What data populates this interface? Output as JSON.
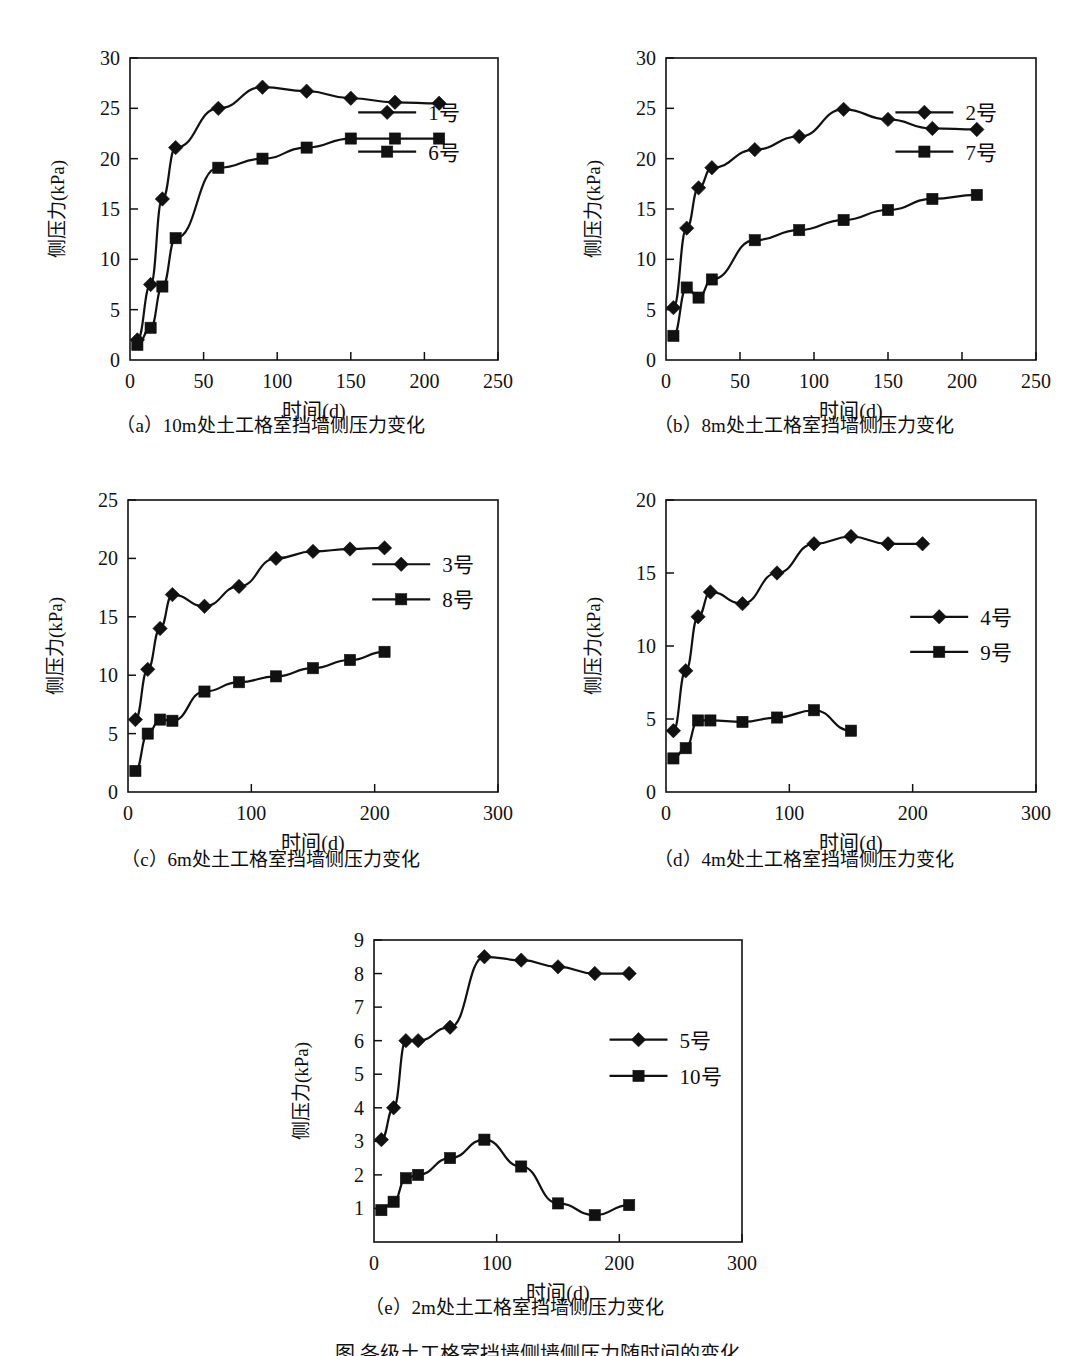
{
  "figure": {
    "bottom_caption": "图  各级土工格室挡墙侧墙侧压力随时间的变化"
  },
  "common": {
    "xlabel": "时间(d)",
    "ylabel": "侧压力(kPa)"
  },
  "panels": [
    {
      "key": "a",
      "caption": "（a）10m处土工格室挡墙侧压力变化",
      "xticks": [
        "0",
        "50",
        "100",
        "150",
        "200",
        "250"
      ],
      "yticks": [
        "0",
        "5",
        "10",
        "15",
        "20",
        "25",
        "30"
      ],
      "legend": [
        "1号",
        "6号"
      ]
    },
    {
      "key": "b",
      "caption": "（b）8m处土工格室挡墙侧压力变化",
      "xticks": [
        "0",
        "50",
        "100",
        "150",
        "200",
        "250"
      ],
      "yticks": [
        "0",
        "5",
        "10",
        "15",
        "20",
        "25",
        "30"
      ],
      "legend": [
        "2号",
        "7号"
      ]
    },
    {
      "key": "c",
      "caption": "（c）6m处土工格室挡墙侧压力变化",
      "xticks": [
        "0",
        "100",
        "200",
        "300"
      ],
      "yticks": [
        "0",
        "5",
        "10",
        "15",
        "20",
        "25"
      ],
      "legend": [
        "3号",
        "8号"
      ]
    },
    {
      "key": "d",
      "caption": "（d）4m处土工格室挡墙侧压力变化",
      "xticks": [
        "0",
        "100",
        "200",
        "300"
      ],
      "yticks": [
        "0",
        "5",
        "10",
        "15",
        "20"
      ],
      "legend": [
        "4号",
        "9号"
      ]
    },
    {
      "key": "e",
      "caption": "（e）2m处土工格室挡墙侧压力变化",
      "xticks": [
        "0",
        "100",
        "200",
        "300"
      ],
      "yticks": [
        "1",
        "2",
        "3",
        "4",
        "5",
        "6",
        "7",
        "8",
        "9"
      ],
      "legend": [
        "5号",
        "10号"
      ]
    }
  ],
  "chart_data": [
    {
      "id": "a",
      "type": "line",
      "title": "（a）10m处土工格室挡墙侧压力变化",
      "xlabel": "时间(d)",
      "ylabel": "侧压力(kPa)",
      "xlim": [
        0,
        250
      ],
      "ylim": [
        0,
        30
      ],
      "xticks": [
        0,
        50,
        100,
        150,
        200,
        250
      ],
      "yticks": [
        0,
        5,
        10,
        15,
        20,
        25,
        30
      ],
      "grid": false,
      "legend_position": "lower-right",
      "series": [
        {
          "name": "1号",
          "marker": "diamond",
          "x": [
            5,
            14,
            22,
            31,
            60,
            90,
            120,
            150,
            180,
            210
          ],
          "values": [
            2.0,
            7.5,
            16.0,
            21.1,
            25.0,
            27.1,
            26.7,
            26.0,
            25.6,
            25.5
          ]
        },
        {
          "name": "6号",
          "marker": "square",
          "x": [
            5,
            14,
            22,
            31,
            60,
            90,
            120,
            150,
            180,
            210
          ],
          "values": [
            1.5,
            3.2,
            7.3,
            12.1,
            19.1,
            20.0,
            21.1,
            22.0,
            22.0,
            22.0
          ]
        }
      ]
    },
    {
      "id": "b",
      "type": "line",
      "title": "（b）8m处土工格室挡墙侧压力变化",
      "xlabel": "时间(d)",
      "ylabel": "侧压力(kPa)",
      "xlim": [
        0,
        250
      ],
      "ylim": [
        0,
        30
      ],
      "xticks": [
        0,
        50,
        100,
        150,
        200,
        250
      ],
      "yticks": [
        0,
        5,
        10,
        15,
        20,
        25,
        30
      ],
      "grid": false,
      "legend_position": "lower-right",
      "series": [
        {
          "name": "2号",
          "marker": "diamond",
          "x": [
            5,
            14,
            22,
            31,
            60,
            90,
            120,
            150,
            180,
            210
          ],
          "values": [
            5.2,
            13.1,
            17.1,
            19.1,
            20.9,
            22.2,
            24.9,
            23.9,
            23.0,
            22.9
          ]
        },
        {
          "name": "7号",
          "marker": "square",
          "x": [
            5,
            14,
            22,
            31,
            60,
            90,
            120,
            150,
            180,
            210
          ],
          "values": [
            2.4,
            7.2,
            6.2,
            8.0,
            11.9,
            12.9,
            13.9,
            14.9,
            16.0,
            16.4
          ]
        }
      ]
    },
    {
      "id": "c",
      "type": "line",
      "title": "（c）6m处土工格室挡墙侧压力变化",
      "xlabel": "时间(d)",
      "ylabel": "侧压力(kPa)",
      "xlim": [
        0,
        300
      ],
      "ylim": [
        0,
        25
      ],
      "xticks": [
        0,
        100,
        200,
        300
      ],
      "yticks": [
        0,
        5,
        10,
        15,
        20,
        25
      ],
      "grid": false,
      "legend_position": "lower-right",
      "series": [
        {
          "name": "3号",
          "marker": "diamond",
          "x": [
            6,
            16,
            26,
            36,
            62,
            90,
            120,
            150,
            180,
            208
          ],
          "values": [
            6.2,
            10.5,
            14.0,
            16.9,
            15.9,
            17.6,
            20.0,
            20.6,
            20.8,
            20.9
          ]
        },
        {
          "name": "8号",
          "marker": "square",
          "x": [
            6,
            16,
            26,
            36,
            62,
            90,
            120,
            150,
            180,
            208
          ],
          "values": [
            1.8,
            5.0,
            6.2,
            6.1,
            8.6,
            9.4,
            9.9,
            10.6,
            11.3,
            12.0
          ]
        }
      ]
    },
    {
      "id": "d",
      "type": "line",
      "title": "（d）4m处土工格室挡墙侧压力变化",
      "xlabel": "时间(d)",
      "ylabel": "侧压力(kPa)",
      "xlim": [
        0,
        300
      ],
      "ylim": [
        0,
        20
      ],
      "xticks": [
        0,
        100,
        200,
        300
      ],
      "yticks": [
        0,
        5,
        10,
        15,
        20
      ],
      "grid": false,
      "legend_position": "middle-right",
      "series": [
        {
          "name": "4号",
          "marker": "diamond",
          "x": [
            6,
            16,
            26,
            36,
            62,
            90,
            120,
            150,
            180,
            208
          ],
          "values": [
            4.2,
            8.3,
            12.0,
            13.7,
            12.9,
            15.0,
            17.0,
            17.5,
            17.0,
            17.0
          ]
        },
        {
          "name": "9号",
          "marker": "square",
          "x": [
            6,
            16,
            26,
            36,
            62,
            90,
            120,
            150
          ],
          "values": [
            2.3,
            3.0,
            4.9,
            4.9,
            4.8,
            5.1,
            5.6,
            4.2
          ]
        }
      ]
    },
    {
      "id": "e",
      "type": "line",
      "title": "（e）2m处土工格室挡墙侧压力变化",
      "xlabel": "时间(d)",
      "ylabel": "侧压力(kPa)",
      "xlim": [
        0,
        300
      ],
      "ylim": [
        0,
        9
      ],
      "xticks": [
        0,
        100,
        200,
        300
      ],
      "yticks": [
        1,
        2,
        3,
        4,
        5,
        6,
        7,
        8,
        9
      ],
      "grid": false,
      "legend_position": "middle-right",
      "series": [
        {
          "name": "5号",
          "marker": "diamond",
          "x": [
            6,
            16,
            26,
            36,
            62,
            90,
            120,
            150,
            180,
            208
          ],
          "values": [
            3.05,
            4.0,
            6.0,
            6.0,
            6.4,
            8.5,
            8.4,
            8.2,
            8.0,
            8.0
          ]
        },
        {
          "name": "10号",
          "marker": "square",
          "x": [
            6,
            16,
            26,
            36,
            62,
            90,
            120,
            150,
            180,
            208
          ],
          "values": [
            0.95,
            1.2,
            1.9,
            2.0,
            2.5,
            3.05,
            2.25,
            1.15,
            0.8,
            1.1
          ]
        }
      ]
    }
  ]
}
